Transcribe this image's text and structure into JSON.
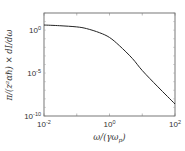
{
  "chart_data": {
    "type": "line",
    "title": "",
    "xlabel": "ω/(γω_p)",
    "ylabel": "π/(z²αℏ) × dI/dω",
    "xscale": "log",
    "yscale": "log",
    "xlim": [
      0.01,
      100
    ],
    "ylim": [
      1e-10,
      100
    ],
    "grid": false,
    "legend": null,
    "x_ticks": [
      {
        "base": "10",
        "exp": "-2",
        "value": 0.01
      },
      {
        "base": "10",
        "exp": "0",
        "value": 1
      },
      {
        "base": "10",
        "exp": "2",
        "value": 100
      }
    ],
    "y_ticks": [
      {
        "base": "10",
        "exp": "0",
        "value": 1
      },
      {
        "base": "10",
        "exp": "-5",
        "value": 1e-05
      },
      {
        "base": "10",
        "exp": "-10",
        "value": 1e-10
      }
    ],
    "series": [
      {
        "name": "spectrum",
        "color": "#222222",
        "x": [
          0.01,
          0.03,
          0.1,
          0.2,
          0.5,
          1,
          2,
          5,
          10,
          30,
          100
        ],
        "log10_y": [
          0.6,
          0.52,
          0.38,
          0.18,
          -0.3,
          -0.85,
          -1.8,
          -3.3,
          -4.7,
          -6.6,
          -8.6
        ]
      }
    ]
  },
  "labels": {
    "xlabel": "ω/(γω",
    "xlabel_sub": "p",
    "xlabel_end": ")",
    "ylabel": "π/(z²αℏ) × dI/dω"
  }
}
